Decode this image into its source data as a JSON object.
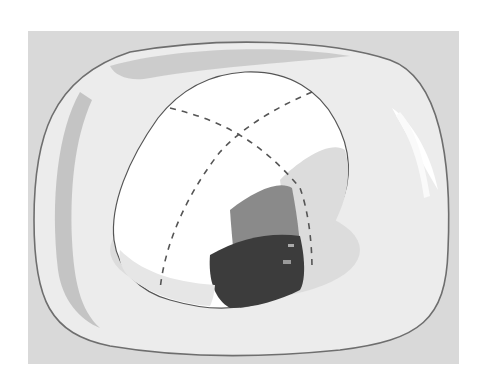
{
  "figure": {
    "background_color": "#d9d9d9",
    "plate": {
      "rim_color": "#6e6e6e",
      "surface_color": "#eeeeee",
      "shadow_color": "#bdbdbd"
    },
    "cake": {
      "top_color": "#ffffff",
      "side_color": "#f2f2f2",
      "cut_face_dark": "#3c3c3c",
      "cut_face_mid": "#8a8a8a",
      "cut_face_light": "#c8c8c8"
    },
    "cut_lines": {
      "style": "dashed",
      "color": "#555555",
      "count": 2
    },
    "caption": {
      "text": "",
      "visible": "cropped at bottom edge"
    }
  }
}
